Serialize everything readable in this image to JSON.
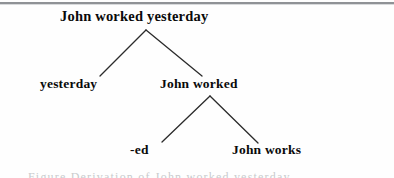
{
  "figure": {
    "type": "derivation-tree",
    "background_color": "#fefefe",
    "text_color": "#0a0a0a",
    "edge_color": "#2b2b2b",
    "rule_color": "#8f9296",
    "caption_partial": "Figure Derivation of John worked yesterday"
  },
  "tree": {
    "root": {
      "id": "root",
      "label": "John worked yesterday",
      "apex": {
        "x": 146,
        "y": 30
      }
    },
    "level1": [
      {
        "id": "yesterday",
        "label": "yesterday",
        "terminal": true,
        "attach": {
          "x": 100,
          "y": 76
        }
      },
      {
        "id": "john-worked",
        "label": "John worked",
        "terminal": false,
        "attach": {
          "x": 202,
          "y": 76
        },
        "apex": {
          "x": 210,
          "y": 96
        }
      }
    ],
    "level2": [
      {
        "id": "ed",
        "label": "-ed",
        "terminal": true,
        "attach": {
          "x": 162,
          "y": 142
        }
      },
      {
        "id": "john-works",
        "label": "John works",
        "terminal": true,
        "attach": {
          "x": 258,
          "y": 143
        }
      }
    ],
    "edges": [
      {
        "from": "root",
        "to": "yesterday",
        "x1": 146,
        "y1": 30,
        "x2": 100,
        "y2": 76
      },
      {
        "from": "root",
        "to": "john-worked",
        "x1": 146,
        "y1": 30,
        "x2": 202,
        "y2": 76
      },
      {
        "from": "john-worked",
        "to": "ed",
        "x1": 210,
        "y1": 96,
        "x2": 162,
        "y2": 142
      },
      {
        "from": "john-worked",
        "to": "john-works",
        "x1": 210,
        "y1": 96,
        "x2": 258,
        "y2": 143
      }
    ]
  }
}
